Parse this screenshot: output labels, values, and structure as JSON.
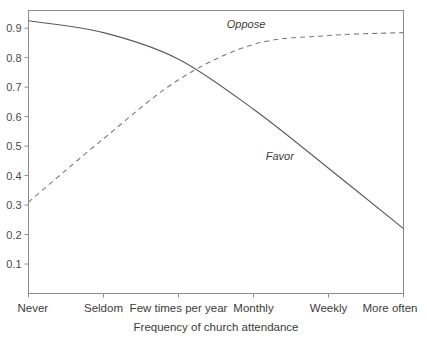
{
  "chart_data": {
    "type": "line",
    "title": "",
    "xlabel": "Frequency of church attendance",
    "ylabel": "",
    "grid": false,
    "legend_position": "inline-annotations",
    "categories": [
      "Never",
      "Seldom",
      "Few times per year",
      "Monthly",
      "Weekly",
      "More often"
    ],
    "x": [
      0,
      1,
      2,
      3,
      4,
      5
    ],
    "xlim": [
      0,
      5
    ],
    "ylim": [
      0,
      0.96
    ],
    "ytick_labels": [
      "0.1",
      "0.2",
      "0.3",
      "0.4",
      "0.5",
      "0.6",
      "0.7",
      "0.8",
      "0.9"
    ],
    "yticks": [
      0.1,
      0.2,
      0.3,
      0.4,
      0.5,
      0.6,
      0.7,
      0.8,
      0.9
    ],
    "series": [
      {
        "name": "Favor",
        "style": "solid",
        "label": "Favor",
        "values": [
          0.925,
          0.885,
          0.795,
          0.625,
          0.425,
          0.22
        ]
      },
      {
        "name": "Oppose",
        "style": "dashed",
        "label": "Oppose",
        "values": [
          0.31,
          0.525,
          0.725,
          0.845,
          0.875,
          0.885
        ]
      }
    ],
    "annotations": [
      {
        "text": "Oppose",
        "x": 2.9,
        "y": 0.915
      },
      {
        "text": "Favor",
        "x": 3.35,
        "y": 0.465
      }
    ]
  },
  "axis": {
    "x_title": "Frequency of church attendance"
  }
}
